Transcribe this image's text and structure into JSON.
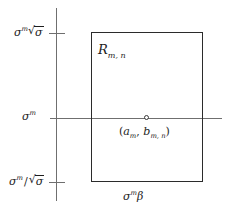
{
  "figure": {
    "kind": "mathematical-diagram",
    "background_color": "#ffffff",
    "line_color": "#6f6f6f",
    "rect_border_color": "#2b2b2b",
    "text_color": "#1d1d1d"
  },
  "axis_labels": {
    "y_upper": {
      "base": "σ",
      "exponent": "m",
      "radicand": "σ",
      "text": "σᵐ√σ"
    },
    "y_middle": {
      "base": "σ",
      "exponent": "m",
      "text": "σᵐ"
    },
    "y_lower": {
      "base": "σ",
      "exponent": "m",
      "separator": "/",
      "radicand": "σ",
      "text": "σᵐ/√σ"
    },
    "x_bottom": {
      "base": "σ",
      "exponent": "m",
      "factor": "β",
      "text": "σᵐβ"
    }
  },
  "annotations": {
    "region": {
      "symbol": "R",
      "subscript": "m, n",
      "text": "Rₘ,ₙ"
    },
    "point": {
      "open_paren": "(",
      "first": "a",
      "first_sub": "m",
      "comma": ",",
      "second": "b",
      "second_sub": "m, n",
      "close_paren": ")",
      "text": "(aₘ, bₘ,ₙ)"
    }
  },
  "marks": {
    "tick_upper_label_ref": "y_upper",
    "tick_lower_label_ref": "y_lower",
    "point_marker": "open-circle"
  }
}
